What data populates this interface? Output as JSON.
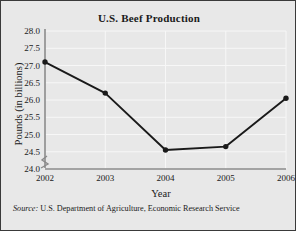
{
  "figure": {
    "title": "U.S. Beef Production",
    "source_lead": "Source:",
    "source_text": "U.S. Department of Agriculture, Economic Research Service",
    "background_color": "#e8e8e8",
    "border_color": "#3a3a3a",
    "gridline_color": "#f7f7f7",
    "axis_color": "#8a8a8a",
    "series_color": "#1a1a1a"
  },
  "chart_data": {
    "type": "line",
    "title": "U.S. Beef Production",
    "xlabel": "Year",
    "ylabel": "Pounds (in billions)",
    "categories": [
      "2002",
      "2003",
      "2004",
      "2005",
      "2006"
    ],
    "x": [
      2002,
      2003,
      2004,
      2005,
      2006
    ],
    "values": [
      27.1,
      26.2,
      24.55,
      24.65,
      26.05
    ],
    "series": [
      {
        "name": "U.S. Beef Production",
        "values": [
          27.1,
          26.2,
          24.55,
          24.65,
          26.05
        ]
      }
    ],
    "ylim": [
      24.0,
      28.0
    ],
    "y_ticks": [
      "28.0",
      "27.5",
      "27.0",
      "26.5",
      "26.0",
      "25.5",
      "25.0",
      "24.5",
      "24.0"
    ],
    "y_tick_values": [
      28.0,
      27.5,
      27.0,
      26.5,
      26.0,
      25.5,
      25.0,
      24.5,
      24.0
    ],
    "x_ticks": [
      "2002",
      "2003",
      "2004",
      "2005",
      "2006"
    ],
    "grid": true,
    "legend": "none",
    "y_axis_break": true,
    "marker": "filled-circle",
    "annotations": [
      "Source: U.S. Department of Agriculture, Economic Research Service"
    ]
  }
}
